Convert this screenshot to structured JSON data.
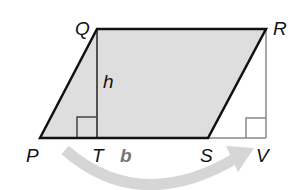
{
  "diagram": {
    "vertices": {
      "P": {
        "label": "P",
        "x": 40,
        "y": 138
      },
      "Q": {
        "label": "Q",
        "x": 97,
        "y": 29
      },
      "R": {
        "label": "R",
        "x": 266,
        "y": 29
      },
      "S": {
        "label": "S",
        "x": 208,
        "y": 138
      },
      "T": {
        "label": "T",
        "x": 97,
        "y": 138
      },
      "V": {
        "label": "V",
        "x": 266,
        "y": 138
      }
    },
    "height_label": "h",
    "base_label": "b",
    "colors": {
      "fill": "#dedede",
      "outline": "#111111",
      "thin_line": "#888888",
      "arrow": "#d4d4d4",
      "base_label": "#777777"
    }
  }
}
